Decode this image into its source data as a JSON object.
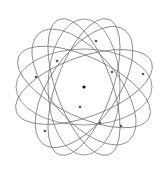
{
  "diagram": {
    "type": "atom-orbital-model",
    "nucleus": {
      "cx": 84,
      "cy": 87,
      "r": 1.6,
      "color": "#111111"
    },
    "orbit_color": "#6b6b6b",
    "electron_color": "#555555",
    "orbits": [
      {
        "rx": 72,
        "ry": 30,
        "angle": -20
      },
      {
        "rx": 72,
        "ry": 30,
        "angle": 25
      },
      {
        "rx": 72,
        "ry": 28,
        "angle": 70
      },
      {
        "rx": 72,
        "ry": 28,
        "angle": 110
      },
      {
        "rx": 70,
        "ry": 34,
        "angle": -55
      },
      {
        "rx": 70,
        "ry": 34,
        "angle": 50
      },
      {
        "rx": 68,
        "ry": 38,
        "angle": 0
      },
      {
        "rx": 68,
        "ry": 36,
        "angle": 90
      }
    ],
    "electrons": [
      {
        "cx": 96,
        "cy": 41
      },
      {
        "cx": 57,
        "cy": 61
      },
      {
        "cx": 36,
        "cy": 77
      },
      {
        "cx": 112,
        "cy": 72
      },
      {
        "cx": 143,
        "cy": 74
      },
      {
        "cx": 80,
        "cy": 107
      },
      {
        "cx": 100,
        "cy": 123
      },
      {
        "cx": 121,
        "cy": 126
      },
      {
        "cx": 45,
        "cy": 131
      }
    ]
  }
}
